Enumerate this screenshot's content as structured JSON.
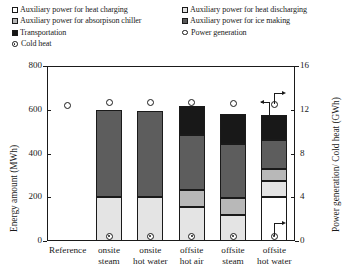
{
  "legend": {
    "left": [
      {
        "label": "Auxiliary power for heat charging",
        "marker": "square-open"
      },
      {
        "label": "Auxiliary power for absorpison chiller",
        "marker": "square-mid"
      },
      {
        "label": "Transportation",
        "marker": "square-black"
      },
      {
        "label": "Cold heat",
        "marker": "diamond-open"
      }
    ],
    "right": [
      {
        "label": "Auxiliary power for heat discharging",
        "marker": "square-light"
      },
      {
        "label": "Auxiliary power for ice making",
        "marker": "square-dark"
      },
      {
        "label": "Power generation",
        "marker": "circle-open"
      }
    ]
  },
  "chart_data": {
    "type": "bar",
    "title": "",
    "xlabel": "",
    "ylabel": "Energy amount (MWh)",
    "y2label": "Power generation/ Cold heat (GWh)",
    "categories": [
      "Reference",
      "onsite steam",
      "onsite hot water",
      "offsite hot air",
      "offsite steam",
      "offsite hot water"
    ],
    "category_lines": [
      [
        "Reference",
        ""
      ],
      [
        "onsite",
        "steam"
      ],
      [
        "onsite",
        "hot water"
      ],
      [
        "offsite",
        "hot air"
      ],
      [
        "offsite",
        "steam"
      ],
      [
        "offsite",
        "hot water"
      ]
    ],
    "ylim": [
      0,
      800
    ],
    "yticks": [
      0,
      200,
      400,
      600,
      800
    ],
    "y2lim": [
      0,
      16
    ],
    "y2ticks": [
      0,
      4,
      8,
      12,
      16
    ],
    "grid": false,
    "stacked": true,
    "series": [
      {
        "name": "Auxiliary power for heat charging",
        "fill": "open",
        "values": [
          0,
          0,
          0,
          0,
          0,
          200
        ]
      },
      {
        "name": "Auxiliary power for heat discharging",
        "fill": "light",
        "values": [
          0,
          200,
          200,
          155,
          120,
          75
        ]
      },
      {
        "name": "Auxiliary power for absorpison chiller",
        "fill": "mid",
        "values": [
          0,
          0,
          0,
          80,
          75,
          55
        ]
      },
      {
        "name": "Auxiliary power for ice making",
        "fill": "dark",
        "values": [
          0,
          400,
          395,
          250,
          250,
          130
        ]
      },
      {
        "name": "Transportation",
        "fill": "black",
        "values": [
          0,
          0,
          0,
          130,
          135,
          115
        ]
      }
    ],
    "bar_totals": [
      0,
      600,
      595,
      615,
      580,
      575
    ],
    "point_series": [
      {
        "name": "Power generation",
        "marker": "circle-open",
        "axis": "right",
        "values": [
          12.4,
          12.7,
          12.7,
          12.7,
          12.6,
          12.5
        ],
        "annotation": {
          "category": "offsite hot water",
          "arrow": "right"
        }
      },
      {
        "name": "Cold heat",
        "marker": "diamond-open",
        "axis": "right",
        "values": [
          null,
          0.45,
          0.45,
          0.45,
          0.45,
          0.45
        ],
        "annotation": {
          "category": "offsite hot water",
          "arrow": "right"
        }
      }
    ],
    "annotations": [
      {
        "text": "",
        "type": "arrow-to-right-axis",
        "target": "power-generation-offsite-hot-water"
      },
      {
        "text": "",
        "type": "arrow-to-left-axis",
        "target": "bar-offsite-hot-water"
      },
      {
        "text": "",
        "type": "arrow-to-right-axis",
        "target": "cold-heat-offsite-hot-water"
      }
    ]
  }
}
